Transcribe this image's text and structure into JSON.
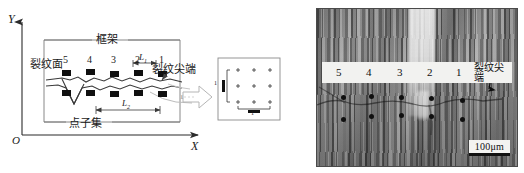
{
  "figure": {
    "title": "",
    "colors": {
      "ink": "#1a1a1a",
      "strip_bg": "#f2f2f0",
      "micrograph_mid": "#8e8e8e"
    }
  },
  "left_panel": {
    "name": "schematic-diagram",
    "axes": {
      "y_label": "Y",
      "x_label": "X",
      "origin_label": "O"
    },
    "annotations": {
      "frame": "框架",
      "crack_surface": "裂纹面",
      "crack_tip": "裂纹尖端",
      "point_subset": "点子集",
      "length_1": "L",
      "length_1_sub": "1",
      "length_2": "L",
      "length_2_sub": "2"
    },
    "column_labels": [
      "5",
      "4",
      "3",
      "2",
      "1"
    ],
    "marker_rows": [
      {
        "row": "upper",
        "y": 78,
        "x_positions": [
          66,
          90,
          114,
          138,
          162
        ]
      },
      {
        "row": "lower",
        "y": 95,
        "x_positions": [
          66,
          90,
          114,
          138,
          162
        ]
      }
    ],
    "inset": {
      "name": "point-subset-inset",
      "grid_columns": 3,
      "grid_rows": 3,
      "marker_glyph": "+",
      "v_label": "1",
      "h_label": "1"
    }
  },
  "right_panel": {
    "name": "micrograph",
    "column_labels": [
      "5",
      "4",
      "3",
      "2",
      "1"
    ],
    "crack_tip_label": "裂纹尖端",
    "scale_bar": "100μm",
    "marker_rows": [
      {
        "row": "upper",
        "y": 86,
        "x_positions": [
          24,
          52,
          82,
          112,
          143
        ]
      },
      {
        "row": "lower",
        "y": 106,
        "x_positions": [
          24,
          52,
          82,
          112,
          143
        ]
      }
    ]
  }
}
